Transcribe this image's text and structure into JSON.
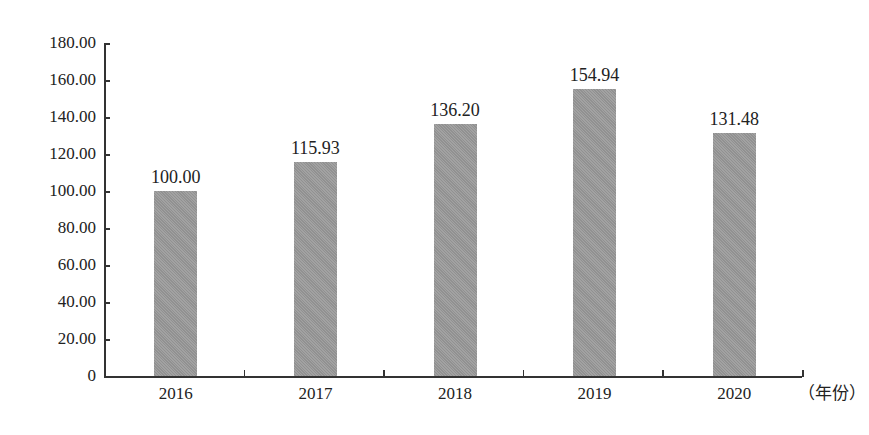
{
  "chart_data": {
    "type": "bar",
    "title": "",
    "xlabel": "（年份）",
    "ylabel": "",
    "categories": [
      "2016",
      "2017",
      "2018",
      "2019",
      "2020"
    ],
    "values": [
      100.0,
      115.93,
      136.2,
      154.94,
      131.48
    ],
    "value_labels": [
      "100.00",
      "115.93",
      "136.20",
      "154.94",
      "131.48"
    ],
    "ylim": [
      0,
      180
    ],
    "yticks": [
      "0",
      "20.00",
      "40.00",
      "60.00",
      "80.00",
      "100.00",
      "120.00",
      "140.00",
      "160.00",
      "180.00"
    ],
    "grid": false,
    "legend": null,
    "bar_color": "#9a9a9a"
  }
}
